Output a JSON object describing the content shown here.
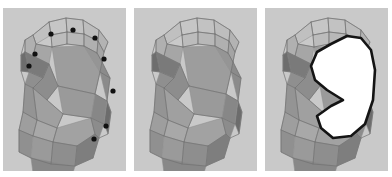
{
  "figure": {
    "background_color": "#ffffff",
    "panel_background": "#c9c9c9",
    "panel_count": 3,
    "panel_width": 123,
    "panel_height": 163
  },
  "palette": {
    "panel_bg": "#c9c9c9",
    "face_lightest": "#c6c6c6",
    "face_light": "#b4b4b4",
    "face_mid": "#9d9d9d",
    "face_mid_dark": "#8a8a8a",
    "face_dark": "#767676",
    "face_darkest": "#5f5f5f",
    "wire_stroke": "#6f6f6f",
    "wire_stroke_light": "#8f8f8f",
    "marker_fill": "#111111",
    "cutout_fill": "#ffffff",
    "cutout_outline": "#141414"
  },
  "panels": [
    {
      "id": "panel-1",
      "label": "Low-poly head with selected vertices",
      "has_markers": true,
      "has_cutout": false,
      "marker_count": 9,
      "marker_radius": 2.6,
      "markers": [
        {
          "name": "vertex-marker-1",
          "x": 48,
          "y": 26
        },
        {
          "name": "vertex-marker-2",
          "x": 70,
          "y": 22
        },
        {
          "name": "vertex-marker-3",
          "x": 92,
          "y": 30
        },
        {
          "name": "vertex-marker-4",
          "x": 32,
          "y": 46
        },
        {
          "name": "vertex-marker-5",
          "x": 26,
          "y": 58
        },
        {
          "name": "vertex-marker-6",
          "x": 101,
          "y": 51
        },
        {
          "name": "vertex-marker-7",
          "x": 110,
          "y": 83
        },
        {
          "name": "vertex-marker-8",
          "x": 103,
          "y": 118
        },
        {
          "name": "vertex-marker-9",
          "x": 91,
          "y": 131
        }
      ]
    },
    {
      "id": "panel-2",
      "label": "Low-poly head without markers",
      "has_markers": false,
      "has_cutout": false,
      "marker_count": 0,
      "markers": []
    },
    {
      "id": "panel-3",
      "label": "Low-poly head with white cut-out region",
      "has_markers": false,
      "has_cutout": true,
      "marker_count": 0,
      "markers": [],
      "cutout_label": "white-region"
    }
  ],
  "mesh": {
    "name": "stylized-head-side-view",
    "orientation": "facing-left",
    "faces": [
      {
        "name": "crown-top-left",
        "points": "46,14 63,10 64,24 48,27",
        "fill": "#c6c6c6"
      },
      {
        "name": "crown-top-mid",
        "points": "63,10 80,12 81,26 64,24",
        "fill": "#c2c2c2"
      },
      {
        "name": "crown-top-right",
        "points": "80,12 96,22 95,33 81,26",
        "fill": "#bdbdbd"
      },
      {
        "name": "crown-top-far",
        "points": "96,22 105,34 101,44 95,33",
        "fill": "#b3b3b3"
      },
      {
        "name": "crown-top-lead",
        "points": "46,14 48,27 33,36 30,27",
        "fill": "#c0c0c0"
      },
      {
        "name": "brow-band-left",
        "points": "48,27 64,24 64,36 49,39",
        "fill": "#bcbcbc"
      },
      {
        "name": "brow-band-mid",
        "points": "64,24 81,26 81,38 64,36",
        "fill": "#b8b8b8"
      },
      {
        "name": "brow-band-right",
        "points": "81,26 95,33 94,45 81,38",
        "fill": "#b0b0b0"
      },
      {
        "name": "brow-band-far",
        "points": "95,33 101,44 99,54 94,45",
        "fill": "#a4a4a4"
      },
      {
        "name": "forehead-lead",
        "points": "33,36 49,39 46,56 30,48",
        "fill": "#a6a6a6"
      },
      {
        "name": "skull-upper-main",
        "points": "49,39 81,38 97,64 92,86 55,78",
        "fill": "#9d9d9d"
      },
      {
        "name": "skull-upper-tilt",
        "points": "81,38 94,45 99,54 97,64",
        "fill": "#959595"
      },
      {
        "name": "skull-back-upper",
        "points": "99,54 107,70 104,93 97,64",
        "fill": "#8b8b8b"
      },
      {
        "name": "temple-shadow",
        "points": "30,27 33,36 30,48 22,44 22,32",
        "fill": "#b0b0b0"
      },
      {
        "name": "temple-dark",
        "points": "30,48 46,56 40,70 26,64 22,44",
        "fill": "#7a7a7a"
      },
      {
        "name": "brow-ridge-dark",
        "points": "22,44 26,64 18,63 18,47",
        "fill": "#6d6d6d"
      },
      {
        "name": "cheek-mid",
        "points": "46,56 55,78 44,92 30,80 40,70",
        "fill": "#8d8d8d"
      },
      {
        "name": "jaw-upper-front",
        "points": "26,64 40,70 30,80 22,76",
        "fill": "#8f8f8f"
      },
      {
        "name": "skull-mid-main",
        "points": "55,78 92,86 88,110 60,106",
        "fill": "#9a9a9a"
      },
      {
        "name": "skull-back-mid",
        "points": "92,86 104,93 101,116 88,110",
        "fill": "#878787"
      },
      {
        "name": "skull-back-low",
        "points": "101,116 104,93 108,104 105,126",
        "fill": "#6c6c6c"
      },
      {
        "name": "jaw-front-face",
        "points": "44,92 60,106 54,120 34,112 30,80",
        "fill": "#a0a0a0"
      },
      {
        "name": "jaw-notch",
        "points": "22,76 30,80 34,112 20,104",
        "fill": "#949494"
      },
      {
        "name": "chin-block-left",
        "points": "20,104 34,112 30,128 16,122",
        "fill": "#9e9e9e"
      },
      {
        "name": "chin-block-mid",
        "points": "34,112 54,120 50,134 30,128",
        "fill": "#a8a8a8"
      },
      {
        "name": "jaw-low-main",
        "points": "54,120 88,110 92,126 74,138 50,134",
        "fill": "#a2a2a2"
      },
      {
        "name": "jaw-low-right",
        "points": "88,110 101,116 96,130 92,126",
        "fill": "#8c8c8c"
      },
      {
        "name": "neck-left",
        "points": "16,122 30,128 28,150 16,144",
        "fill": "#909090"
      },
      {
        "name": "neck-mid",
        "points": "30,128 50,134 48,156 28,150",
        "fill": "#9a9a9a"
      },
      {
        "name": "neck-right",
        "points": "50,134 74,138 72,158 48,156",
        "fill": "#8e8e8e"
      },
      {
        "name": "neck-far",
        "points": "74,138 92,126 96,130 90,150 72,158",
        "fill": "#7e7e7e"
      },
      {
        "name": "neck-base-shadow",
        "points": "28,150 72,158 70,165 30,165",
        "fill": "#888888"
      }
    ],
    "wires": [
      "46,14 63,10 80,12 96,22 105,34 101,44 99,54 107,70 104,93 108,104 105,126 96,130 90,150",
      "46,14 30,27 22,32 18,47 18,63 22,76 20,104 16,122 16,144 28,150",
      "48,27 64,24 81,26 95,33 101,44",
      "46,14 48,27",
      "63,10 64,24",
      "80,12 81,26",
      "96,22 95,33",
      "49,39 64,36 81,38 94,45 99,54",
      "48,27 49,39",
      "64,24 64,36",
      "81,26 81,38",
      "95,33 94,45",
      "30,27 33,36 49,39",
      "33,36 30,48 46,56 55,78 92,86 104,93",
      "22,32 22,44 18,47",
      "22,44 30,48",
      "22,44 26,64 18,63",
      "26,64 40,70 46,56",
      "40,70 30,80 44,92 55,78",
      "30,80 22,76",
      "44,92 60,106 88,110 101,116",
      "60,106 54,120 50,134 74,138 92,126 96,130",
      "30,80 34,112 20,104",
      "34,112 54,120",
      "34,112 30,128 16,122",
      "30,128 50,134",
      "28,150 48,156 72,158 90,150",
      "50,134 48,156",
      "74,138 72,158",
      "92,86 97,64 99,54",
      "97,64 107,70",
      "88,110 92,126"
    ]
  },
  "cutout": {
    "name": "white-cutout-region",
    "fill": "#ffffff",
    "stroke": "#141414",
    "stroke_width": 2.6,
    "points": "66,36 82,28 96,30 106,42 110,62 108,92 100,116 86,128 68,130 56,120 52,108 66,98 78,92 62,82 50,72 46,58 52,44"
  }
}
